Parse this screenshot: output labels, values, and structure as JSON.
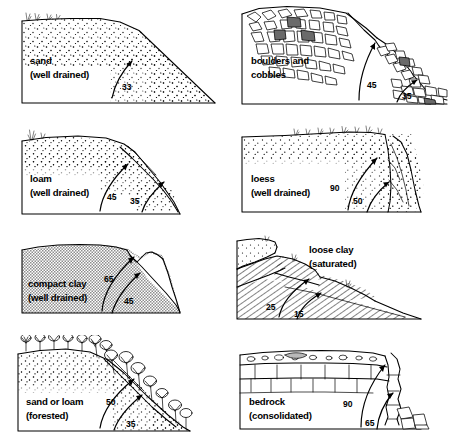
{
  "figure": {
    "background_color": "#ffffff",
    "ink_color": "#000000",
    "angle_unit": "degrees",
    "columns": 2,
    "rows": 4
  },
  "panels": [
    {
      "id": "sand",
      "row": 1,
      "column": 1,
      "material": "sand",
      "condition": "(well drained)",
      "label_line1": "sand",
      "label_line2": "(well drained)",
      "angles": [
        "33"
      ],
      "texture": "stippled-sand",
      "surface_cover": "sparse grass tufts",
      "slope_count": 1
    },
    {
      "id": "boulders-and-cobbles",
      "row": 1,
      "column": 2,
      "material": "boulders and cobbles",
      "condition": "",
      "label_line1": "boulders and",
      "label_line2": "cobbles",
      "angles": [
        "45",
        "35"
      ],
      "texture": "angular-blocks",
      "surface_cover": "none",
      "slope_count": 2
    },
    {
      "id": "loam",
      "row": 2,
      "column": 1,
      "material": "loam",
      "condition": "(well drained)",
      "label_line1": "loam",
      "label_line2": "(well drained)",
      "angles": [
        "45",
        "35"
      ],
      "texture": "stippled-loam",
      "surface_cover": "grass tuft",
      "slope_count": 2
    },
    {
      "id": "loess",
      "row": 2,
      "column": 2,
      "material": "loess",
      "condition": "(well drained)",
      "label_line1": "loess",
      "label_line2": "(well drained)",
      "angles": [
        "90",
        "50"
      ],
      "texture": "fine-stipple",
      "surface_cover": "grass fringe",
      "slope_count": 2
    },
    {
      "id": "compact-clay",
      "row": 3,
      "column": 1,
      "material": "compact clay",
      "condition": "(well drained)",
      "label_line1": "compact clay",
      "label_line2": "(well drained)",
      "angles": [
        "65",
        "45"
      ],
      "texture": "gray-halftone",
      "surface_cover": "none",
      "slope_count": 2
    },
    {
      "id": "loose-clay",
      "row": 3,
      "column": 2,
      "material": "loose clay",
      "condition": "(saturated)",
      "label_line1": "loose clay",
      "label_line2": "(saturated)",
      "angles": [
        "25",
        "15"
      ],
      "texture": "hatched-slump-blocks",
      "surface_cover": "grass tufts",
      "slope_count": 2
    },
    {
      "id": "sand-or-loam-forested",
      "row": 4,
      "column": 1,
      "material": "sand or loam",
      "condition": "(forested)",
      "label_line1": "sand or loam",
      "label_line2": "(forested)",
      "angles": [
        "50",
        "35"
      ],
      "texture": "stippled-sand",
      "surface_cover": "forest trees",
      "slope_count": 2
    },
    {
      "id": "bedrock",
      "row": 4,
      "column": 2,
      "material": "bedrock",
      "condition": "(consolidated)",
      "label_line1": "bedrock",
      "label_line2": "(consolidated)",
      "angles": [
        "90",
        "65"
      ],
      "texture": "stratified-jointed-rock",
      "surface_cover": "gravel regolith cap",
      "slope_count": 2
    }
  ]
}
